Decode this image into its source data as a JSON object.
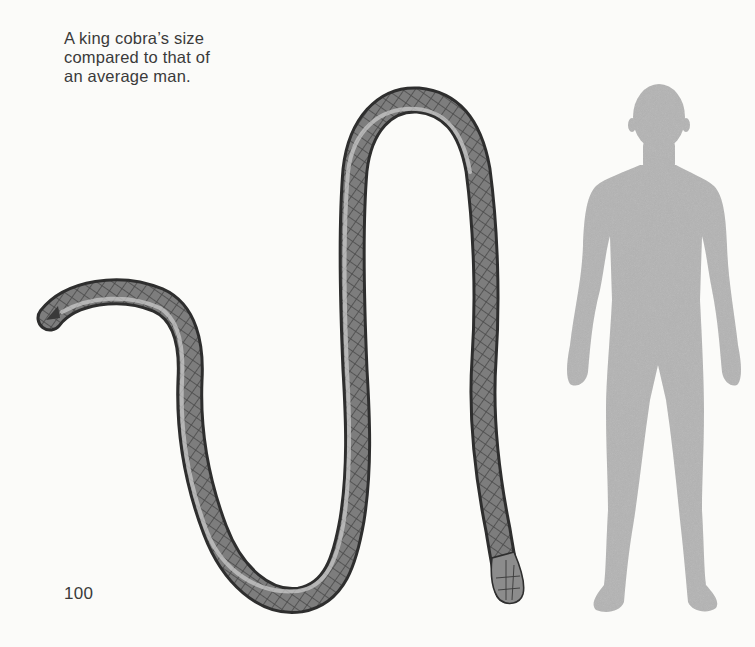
{
  "page": {
    "caption": "A king cobra’s size\ncompared to that of\nan average man.",
    "page_number": "100"
  },
  "illustrations": {
    "snake": {
      "label": "king cobra illustration",
      "icon": "snake-illustration"
    },
    "man": {
      "label": "average man silhouette",
      "icon": "human-silhouette"
    }
  },
  "colors": {
    "background": "#fbfbf9",
    "text": "#3a3a3a",
    "silhouette": "#b4b4b4",
    "snake_dark": "#3c3c3c",
    "snake_mid": "#8a8a8a",
    "snake_light": "#c8c8c8"
  }
}
